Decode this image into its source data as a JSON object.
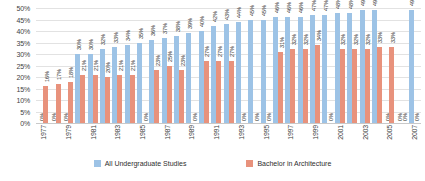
{
  "chart_data": {
    "type": "bar",
    "title": "",
    "xlabel": "",
    "ylabel": "",
    "ylim": [
      0,
      50
    ],
    "grid": true,
    "legend_position": "bottom",
    "categories": [
      "1977",
      "1978",
      "1979",
      "1980",
      "1981",
      "1982",
      "1983",
      "1984",
      "1985",
      "1986",
      "1987",
      "1988",
      "1989",
      "1990",
      "1991",
      "1992",
      "1993",
      "1994",
      "1995",
      "1996",
      "1997",
      "1998",
      "1999",
      "2000",
      "2001",
      "2002",
      "2003",
      "2004",
      "2005",
      "2006",
      "2007"
    ],
    "x_tick_labels": [
      "1977",
      "",
      "1979",
      "",
      "1981",
      "",
      "1983",
      "",
      "1985",
      "",
      "1987",
      "",
      "1989",
      "",
      "1991",
      "",
      "1993",
      "",
      "1995",
      "",
      "1997",
      "",
      "1999",
      "",
      "2001",
      "",
      "2003",
      "",
      "2005",
      "",
      "2007"
    ],
    "y_tick_labels": [
      "0%",
      "5%",
      "10%",
      "15%",
      "20%",
      "25%",
      "30%",
      "35%",
      "40%",
      "45%",
      "50%"
    ],
    "y_tick_values": [
      0,
      5,
      10,
      15,
      20,
      25,
      30,
      35,
      40,
      45,
      50
    ],
    "series": [
      {
        "name": "All Undergraduate Studies",
        "color": "#9dc3e6",
        "values": [
          0,
          0,
          0,
          30,
          30,
          32,
          33,
          34,
          35,
          36,
          37,
          38,
          39,
          40,
          42,
          43,
          44,
          45,
          45,
          46,
          46,
          46,
          47,
          47,
          48,
          48,
          49,
          49,
          0,
          0,
          49
        ],
        "labels": [
          "0%",
          "0%",
          "0%",
          "30%",
          "30%",
          "32%",
          "33%",
          "34%",
          "35%",
          "36%",
          "37%",
          "38%",
          "39%",
          "40%",
          "42%",
          "43%",
          "44%",
          "45%",
          "45%",
          "46%",
          "46%",
          "46%",
          "47%",
          "47%",
          "48%",
          "48%",
          "49%",
          "49%",
          "0%",
          "0%",
          "49%"
        ]
      },
      {
        "name": "Bachelor in Architecture",
        "color": "#e8927c",
        "values": [
          16,
          17,
          18,
          21,
          21,
          20,
          21,
          21,
          0,
          23,
          25,
          23,
          0,
          27,
          27,
          27,
          0,
          0,
          0,
          31,
          32,
          32,
          34,
          0,
          32,
          32,
          32,
          33,
          33,
          0,
          0
        ],
        "labels": [
          "16%",
          "17%",
          "18%",
          "21%",
          "21%",
          "20%",
          "21%",
          "21%",
          "0%",
          "23%",
          "25%",
          "23%",
          "0%",
          "27%",
          "27%",
          "27%",
          "0%",
          "0%",
          "0%",
          "31%",
          "32%",
          "32%",
          "34%",
          "0%",
          "32%",
          "32%",
          "32%",
          "33%",
          "33%",
          "0%",
          "0%"
        ]
      }
    ]
  },
  "legend": {
    "items": [
      {
        "label": "All Undergraduate Studies",
        "color": "#9dc3e6"
      },
      {
        "label": "Bachelor in Architecture",
        "color": "#e8927c"
      }
    ]
  }
}
